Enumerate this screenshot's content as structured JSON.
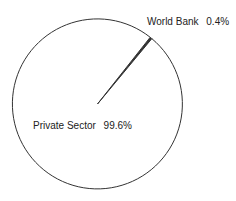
{
  "chart_data": {
    "type": "pie",
    "title": "",
    "categories": [
      "World Bank",
      "Private Sector"
    ],
    "values": [
      0.4,
      99.6
    ],
    "unit": "%",
    "labels": [
      {
        "name": "World Bank",
        "value_text": "0.4%"
      },
      {
        "name": "Private Sector",
        "value_text": "99.6%"
      }
    ],
    "start_angle_deg": 38.3,
    "direction": "clockwise",
    "legend": "none",
    "colors": {
      "fill": "#ffffff",
      "stroke": "#333333",
      "small_slice_fill": "#333333"
    }
  }
}
